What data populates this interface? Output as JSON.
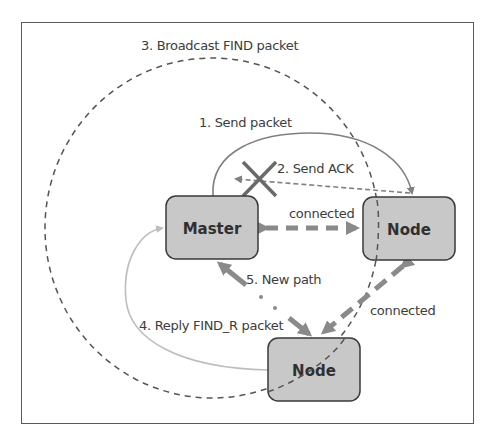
{
  "diagram": {
    "type": "network-flow",
    "nodes": [
      {
        "id": "master",
        "label": "Master"
      },
      {
        "id": "node_right",
        "label": "Node"
      },
      {
        "id": "node_bottom",
        "label": "Node"
      }
    ],
    "labels": {
      "step1": "1. Send packet",
      "step2": "2. Send ACK",
      "step3": "3. Broadcast FIND packet",
      "step4": "4. Reply FIND_R packet",
      "step5": "5. New path",
      "connected_top": "connected",
      "connected_right": "connected"
    },
    "edges": [
      {
        "from": "master",
        "to": "node_right",
        "label": "1. Send packet",
        "style": "solid-curve"
      },
      {
        "from": "node_right",
        "to": "master",
        "label": "2. Send ACK",
        "style": "dashed",
        "failed": true
      },
      {
        "from": "master",
        "to": "broadcast",
        "label": "3. Broadcast FIND packet",
        "style": "dashed-ellipse"
      },
      {
        "from": "node_bottom",
        "to": "master",
        "label": "4. Reply FIND_R packet",
        "style": "light-solid-curve"
      },
      {
        "from": "master",
        "to": "node_bottom",
        "label": "5. New path",
        "style": "dash-dot-thick-bidirectional"
      },
      {
        "from": "master",
        "to": "node_right",
        "label": "connected",
        "style": "dashed-thick-bidirectional"
      },
      {
        "from": "node_bottom",
        "to": "node_right",
        "label": "connected",
        "style": "dashed-thick-bidirectional"
      }
    ],
    "colors": {
      "node_fill": "#c8c8c8",
      "node_stroke": "#3a3a3a",
      "line": "#808080",
      "light_line": "#bdbdbd",
      "text": "#3c3c3c",
      "frame": "#5a5a5a"
    }
  }
}
